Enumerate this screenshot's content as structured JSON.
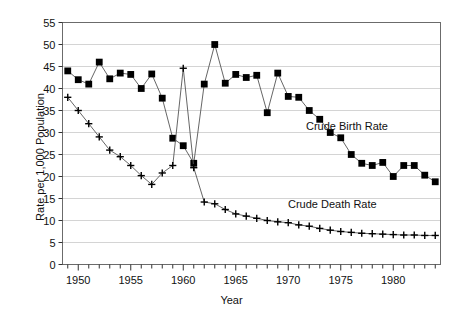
{
  "chart_data": {
    "type": "line",
    "title": "",
    "xlabel": "Year",
    "ylabel": "Rate per 1,000 Population",
    "xlim": [
      1948.5,
      1984.5
    ],
    "ylim": [
      0,
      55
    ],
    "ytick_step": 5,
    "yticks": [
      0,
      5,
      10,
      15,
      20,
      25,
      30,
      35,
      40,
      45,
      50,
      55
    ],
    "ytick_labels": [
      "0",
      "5",
      "10",
      "15",
      "20",
      "25",
      "30",
      "35",
      "40",
      "45",
      "50",
      "55"
    ],
    "xticks": [
      1949,
      1950,
      1951,
      1952,
      1953,
      1954,
      1955,
      1956,
      1957,
      1958,
      1959,
      1960,
      1961,
      1962,
      1963,
      1964,
      1965,
      1966,
      1967,
      1968,
      1969,
      1970,
      1971,
      1972,
      1973,
      1974,
      1975,
      1976,
      1977,
      1978,
      1979,
      1980,
      1981,
      1982,
      1983,
      1984
    ],
    "xtick_labels_major": [
      "1950",
      "1955",
      "1960",
      "1965",
      "1970",
      "1975",
      "1980"
    ],
    "xticks_major": [
      1950,
      1955,
      1960,
      1965,
      1970,
      1975,
      1980
    ],
    "grid": "horizontal",
    "legend_position": "inline-annotation",
    "x": [
      1949,
      1950,
      1951,
      1952,
      1953,
      1954,
      1955,
      1956,
      1957,
      1958,
      1959,
      1960,
      1961,
      1962,
      1963,
      1964,
      1965,
      1966,
      1967,
      1968,
      1969,
      1970,
      1971,
      1972,
      1973,
      1974,
      1975,
      1976,
      1977,
      1978,
      1979,
      1980,
      1981,
      1982,
      1983,
      1984
    ],
    "series": [
      {
        "name": "Crude Birth Rate",
        "marker": "square",
        "color": "#000000",
        "values": [
          44.0,
          42.0,
          41.0,
          46.0,
          42.2,
          43.5,
          43.2,
          40.0,
          43.3,
          37.8,
          28.7,
          27.0,
          23.0,
          41.0,
          50.0,
          41.2,
          43.2,
          42.5,
          43.0,
          34.5,
          43.5,
          38.2,
          38.0,
          35.0,
          33.0,
          30.0,
          28.8,
          25.0,
          23.0,
          22.5,
          23.2,
          20.0,
          22.5,
          22.5,
          20.3,
          18.8
        ]
      },
      {
        "name": "Crude Death Rate",
        "marker": "plus",
        "color": "#000000",
        "values": [
          38.0,
          35.0,
          32.0,
          29.0,
          26.0,
          24.5,
          22.5,
          20.2,
          18.2,
          20.8,
          22.5,
          44.6,
          22.0,
          14.2,
          13.8,
          12.5,
          11.5,
          11.0,
          10.5,
          10.0,
          9.7,
          9.5,
          9.0,
          8.7,
          8.2,
          7.8,
          7.5,
          7.3,
          7.1,
          7.0,
          6.9,
          6.8,
          6.7,
          6.7,
          6.6,
          6.6
        ]
      }
    ],
    "annotations": [
      {
        "name": "birth-series-label",
        "text": "Crude Birth Rate",
        "x": 1973,
        "y": 31
      },
      {
        "name": "death-series-label",
        "text": "Crude Death Rate",
        "x": 1971,
        "y": 13
      }
    ]
  }
}
